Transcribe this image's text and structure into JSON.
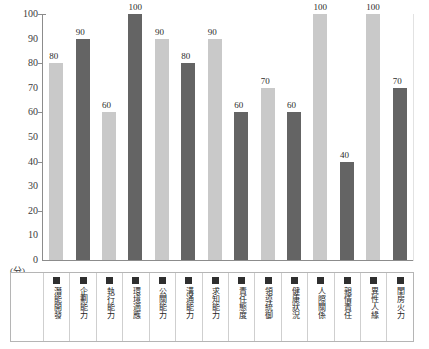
{
  "chart_data": {
    "type": "bar",
    "title": "",
    "xlabel": "",
    "ylabel": "(分)",
    "ylim": [
      0,
      100
    ],
    "ytick_step": 10,
    "grid": false,
    "legend_position": "bottom-table",
    "categories": [
      "潛能開發",
      "企劃能力",
      "執行能力",
      "環境適應",
      "公關能力",
      "溝通能力",
      "求知能力",
      "責任態度",
      "領導統御",
      "健康狀況",
      "人際關係",
      "親情責任",
      "異性人緣",
      "閨房火力"
    ],
    "values": [
      80,
      90,
      60,
      100,
      90,
      80,
      90,
      60,
      70,
      60,
      100,
      40,
      100,
      70
    ],
    "bar_shades": [
      "light",
      "dark",
      "light",
      "dark",
      "light",
      "dark",
      "light",
      "dark",
      "light",
      "dark",
      "light",
      "dark",
      "light",
      "dark"
    ],
    "y_tick_labels": [
      "100",
      "90",
      "80",
      "70",
      "60",
      "50",
      "40",
      "30",
      "20",
      "10",
      "0"
    ],
    "y_ticks_marked": [
      100,
      80,
      60,
      40,
      20
    ],
    "colors": {
      "bar_light": "#c9c9c9",
      "bar_dark": "#646464",
      "axis": "#8c8c8c",
      "text": "#231f20",
      "swatch": "#2f2f2f",
      "table_border": "#b5b5b5"
    }
  }
}
